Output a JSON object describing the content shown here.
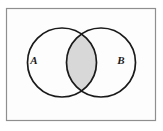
{
  "figure": {
    "name": "venn-diagram-two-sets-intersection-shaded",
    "type": "venn-diagram",
    "canvas": {
      "width": 163,
      "height": 131,
      "background_color": "#ffffff"
    },
    "frame": {
      "name": "universal-set-rectangle",
      "x": 6.5,
      "y": 8.5,
      "width": 149,
      "height": 112,
      "stroke_color": "#8f8f8f",
      "stroke_width": 1.2,
      "fill_color": "#fdfdfd"
    },
    "sets": [
      {
        "id": "A",
        "label": "A",
        "label_x": 34,
        "label_y": 64,
        "circle": {
          "cx": 62,
          "cy": 62.5,
          "r": 34.5
        },
        "stroke_color": "#1a1a1a",
        "stroke_width": 1.7,
        "fill_color": "#ffffff"
      },
      {
        "id": "B",
        "label": "B",
        "label_x": 121,
        "label_y": 64,
        "circle": {
          "cx": 101,
          "cy": 62.5,
          "r": 34.5
        },
        "stroke_color": "#1a1a1a",
        "stroke_width": 1.7,
        "fill_color": "#ffffff"
      }
    ],
    "intersection": {
      "name": "A-intersect-B",
      "shaded": true,
      "fill_color": "#d8d8d8",
      "stroke_color": "#1a1a1a",
      "top_point": {
        "x": 81.5,
        "y": 34.0
      },
      "bottom_point": {
        "x": 81.5,
        "y": 91.0
      }
    }
  }
}
